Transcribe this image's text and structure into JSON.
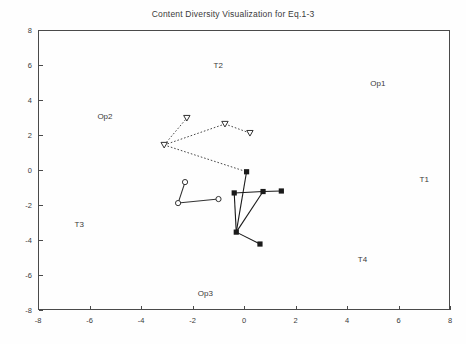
{
  "chart_data": {
    "type": "scatter",
    "title": "Content Diversity Visualization for Eq.1-3",
    "xlabel": "",
    "ylabel": "",
    "xlim": [
      -8,
      8
    ],
    "ylim": [
      -8,
      8
    ],
    "xticks": [
      -8,
      -6,
      -4,
      -2,
      0,
      2,
      4,
      6,
      8
    ],
    "yticks": [
      -8,
      -6,
      -4,
      -2,
      0,
      2,
      4,
      6,
      8
    ],
    "grid": false,
    "legend": "none",
    "annotations": [
      {
        "text": "T2",
        "x": -1.0,
        "y": 6.0
      },
      {
        "text": "Op1",
        "x": 5.2,
        "y": 5.0
      },
      {
        "text": "Op2",
        "x": -5.4,
        "y": 3.1
      },
      {
        "text": "T1",
        "x": 7.0,
        "y": -0.5
      },
      {
        "text": "T3",
        "x": -6.4,
        "y": -3.1
      },
      {
        "text": "T4",
        "x": 4.6,
        "y": -5.1
      },
      {
        "text": "Op3",
        "x": -1.5,
        "y": -7.0
      }
    ],
    "series": [
      {
        "name": "triangles",
        "marker": "triangle-down",
        "linestyle": "dotted",
        "color": "#333333",
        "points": [
          {
            "x": -3.1,
            "y": 1.43
          },
          {
            "x": -2.22,
            "y": 2.97
          },
          {
            "x": -0.74,
            "y": 2.63
          },
          {
            "x": 0.23,
            "y": 2.11
          }
        ],
        "edges": [
          [
            0,
            1
          ],
          [
            0,
            2
          ],
          [
            2,
            3
          ],
          [
            0,
            4
          ]
        ]
      },
      {
        "name": "circles",
        "marker": "circle-open",
        "linestyle": "solid",
        "color": "#333333",
        "points": [
          {
            "x": -2.29,
            "y": -0.69
          },
          {
            "x": -0.99,
            "y": -1.66
          },
          {
            "x": -2.56,
            "y": -1.89
          }
        ],
        "edges": [
          [
            0,
            2
          ],
          [
            2,
            1
          ]
        ]
      },
      {
        "name": "squares",
        "marker": "square-filled",
        "linestyle": "solid",
        "color": "#1a1a1a",
        "points": [
          {
            "x": 0.1,
            "y": -0.1
          },
          {
            "x": 0.74,
            "y": -1.23
          },
          {
            "x": 1.45,
            "y": -1.2
          },
          {
            "x": -0.38,
            "y": -1.31
          },
          {
            "x": -0.3,
            "y": -3.55
          },
          {
            "x": 0.62,
            "y": -4.23
          }
        ],
        "edges": [
          [
            0,
            4
          ],
          [
            3,
            4
          ],
          [
            3,
            1
          ],
          [
            1,
            2
          ],
          [
            1,
            4
          ],
          [
            4,
            5
          ]
        ]
      }
    ],
    "cross_series_edges": [
      {
        "from": [
          "triangles",
          0
        ],
        "to": [
          "squares",
          0
        ],
        "linestyle": "dotted"
      }
    ]
  }
}
